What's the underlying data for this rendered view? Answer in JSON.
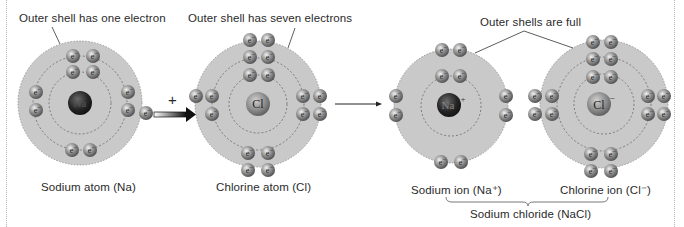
{
  "labels": {
    "na_outer_note": "Outer shell has one electron",
    "cl_outer_note": "Outer shell has seven electrons",
    "ions_outer_note": "Outer shells are full",
    "na_atom": "Sodium atom (Na)",
    "cl_atom": "Chlorine atom (Cl)",
    "na_ion": "Sodium ion (Na⁺)",
    "cl_ion": "Chlorine ion (Cl⁻)",
    "compound": "Sodium chloride (NaCl)",
    "plus_sign": "+",
    "electron_symbol": "e⁻"
  },
  "nuclei": {
    "na_atom": "Na",
    "cl_atom": "Cl",
    "na_ion": "Na+",
    "cl_ion": "Cl−"
  },
  "colors": {
    "shell_fill": "#c9c9c9",
    "electron": "#8a8a8a",
    "na_nucleus": "#2b2b2b",
    "cl_nucleus": "#8c8c8c",
    "text": "#2a2a2a",
    "arrow": "#111111"
  },
  "atoms": [
    {
      "id": "na_atom",
      "electron_count": 11,
      "shells": [
        2,
        8,
        1
      ]
    },
    {
      "id": "cl_atom",
      "electron_count": 17,
      "shells": [
        2,
        8,
        7
      ]
    },
    {
      "id": "na_ion",
      "electron_count": 10,
      "shells": [
        2,
        8
      ]
    },
    {
      "id": "cl_ion",
      "electron_count": 18,
      "shells": [
        2,
        8,
        8
      ]
    }
  ]
}
